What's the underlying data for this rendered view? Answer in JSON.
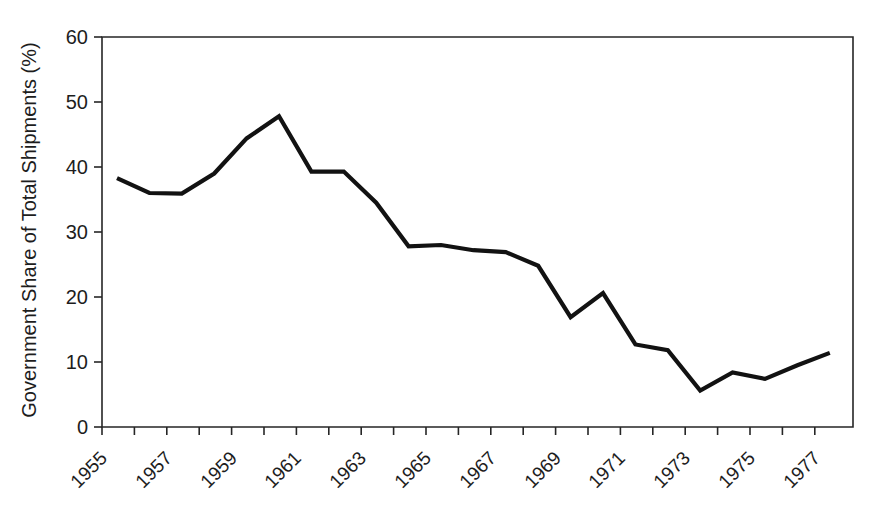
{
  "chart_data": {
    "type": "line",
    "title": "",
    "xlabel": "",
    "ylabel": "Government Share of Total Shipments (%)",
    "ylim": [
      0,
      60
    ],
    "yticks": [
      0,
      10,
      20,
      30,
      40,
      50,
      60
    ],
    "grid": false,
    "legend": "none",
    "x": [
      1955,
      1956,
      1957,
      1958,
      1959,
      1960,
      1961,
      1962,
      1963,
      1964,
      1965,
      1966,
      1967,
      1968,
      1969,
      1970,
      1971,
      1972,
      1973,
      1974,
      1975,
      1976,
      1977
    ],
    "xtick_labels": [
      "1955",
      "",
      "1957",
      "",
      "1959",
      "",
      "1961",
      "",
      "1963",
      "",
      "1965",
      "",
      "1967",
      "",
      "1969",
      "",
      "1971",
      "",
      "1973",
      "",
      "1975",
      "",
      "1977"
    ],
    "xtick_labels_shown": [
      "1955",
      "1957",
      "1959",
      "1961",
      "1963",
      "1965",
      "1967",
      "1969",
      "1971",
      "1973",
      "1975",
      "1977"
    ],
    "series": [
      {
        "name": "Government Share of Total Shipments",
        "color": "#121212",
        "values": [
          38.3,
          36.0,
          35.9,
          39.0,
          44.4,
          47.8,
          39.3,
          39.3,
          34.5,
          27.8,
          28.0,
          27.2,
          26.9,
          24.8,
          16.9,
          20.6,
          12.7,
          11.8,
          5.6,
          8.4,
          7.4,
          9.5,
          11.4
        ]
      }
    ]
  },
  "axis": {
    "y_title": "Government Share of Total Shipments (%)",
    "y_labels": [
      "60",
      "50",
      "40",
      "30",
      "20",
      "10",
      "0"
    ],
    "x_labels": [
      "1955",
      "1957",
      "1959",
      "1961",
      "1963",
      "1965",
      "1967",
      "1969",
      "1971",
      "1973",
      "1975",
      "1977"
    ]
  },
  "colors": {
    "line": "#121212",
    "axis": "#262626",
    "text": "#1d1d1d",
    "background": "#ffffff"
  }
}
